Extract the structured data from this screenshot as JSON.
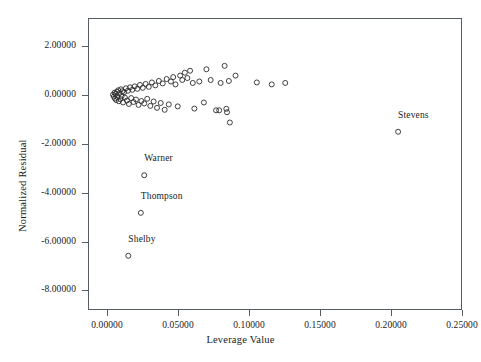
{
  "chart_data": {
    "type": "scatter",
    "title": "",
    "xlabel": "Leverage Value",
    "ylabel": "Normalized Residual",
    "xlim": [
      -0.0134,
      0.25
    ],
    "ylim": [
      -8.8,
      3.16
    ],
    "grid": false,
    "legend": null,
    "xticks": [
      0.0,
      0.05,
      0.1,
      0.15,
      0.2,
      0.25
    ],
    "xticklabels": [
      "0.00000",
      "0.05000",
      "0.10000",
      "0.15000",
      "0.20000",
      "0.25000"
    ],
    "yticks": [
      2.0,
      0.0,
      -2.0,
      -4.0,
      -6.0,
      -8.0
    ],
    "yticklabels": [
      "2.00000",
      "0.00000",
      "-2.00000",
      "-4.00000",
      "-6.00000",
      "-8.00000"
    ],
    "marker": "open-circle",
    "marker_color": "#2b2b2b",
    "points": [
      {
        "x": 0.0042,
        "y": 0.02
      },
      {
        "x": 0.0048,
        "y": -0.06
      },
      {
        "x": 0.0053,
        "y": 0.1
      },
      {
        "x": 0.0056,
        "y": -0.14
      },
      {
        "x": 0.0061,
        "y": 0.05
      },
      {
        "x": 0.0065,
        "y": -0.2
      },
      {
        "x": 0.007,
        "y": 0.14
      },
      {
        "x": 0.0074,
        "y": -0.08
      },
      {
        "x": 0.0079,
        "y": 0.2
      },
      {
        "x": 0.0083,
        "y": -0.25
      },
      {
        "x": 0.0088,
        "y": 0.08
      },
      {
        "x": 0.0093,
        "y": -0.16
      },
      {
        "x": 0.0098,
        "y": 0.24
      },
      {
        "x": 0.0103,
        "y": -0.04
      },
      {
        "x": 0.0108,
        "y": 0.16
      },
      {
        "x": 0.0113,
        "y": -0.3
      },
      {
        "x": 0.012,
        "y": 0.12
      },
      {
        "x": 0.0126,
        "y": -0.1
      },
      {
        "x": 0.0133,
        "y": 0.28
      },
      {
        "x": 0.014,
        "y": -0.22
      },
      {
        "x": 0.0147,
        "y": 0.18
      },
      {
        "x": 0.0154,
        "y": -0.36
      },
      {
        "x": 0.0162,
        "y": 0.32
      },
      {
        "x": 0.017,
        "y": -0.12
      },
      {
        "x": 0.0178,
        "y": 0.22
      },
      {
        "x": 0.0186,
        "y": -0.28
      },
      {
        "x": 0.0195,
        "y": 0.36
      },
      {
        "x": 0.0204,
        "y": -0.18
      },
      {
        "x": 0.0213,
        "y": 0.26
      },
      {
        "x": 0.0222,
        "y": -0.4
      },
      {
        "x": 0.0232,
        "y": 0.42
      },
      {
        "x": 0.0242,
        "y": -0.24
      },
      {
        "x": 0.0252,
        "y": 0.3
      },
      {
        "x": 0.0262,
        "y": -0.34
      },
      {
        "x": 0.0272,
        "y": 0.46
      },
      {
        "x": 0.0283,
        "y": -0.15
      },
      {
        "x": 0.0294,
        "y": 0.34
      },
      {
        "x": 0.0305,
        "y": -0.44
      },
      {
        "x": 0.0316,
        "y": 0.52
      },
      {
        "x": 0.0328,
        "y": -0.26
      },
      {
        "x": 0.034,
        "y": 0.4
      },
      {
        "x": 0.0352,
        "y": -0.52
      },
      {
        "x": 0.0365,
        "y": 0.58
      },
      {
        "x": 0.0378,
        "y": -0.32
      },
      {
        "x": 0.0392,
        "y": 0.48
      },
      {
        "x": 0.0406,
        "y": -0.6
      },
      {
        "x": 0.042,
        "y": 0.66
      },
      {
        "x": 0.0435,
        "y": -0.38
      },
      {
        "x": 0.045,
        "y": 0.56
      },
      {
        "x": 0.0466,
        "y": 0.74
      },
      {
        "x": 0.0482,
        "y": 0.44
      },
      {
        "x": 0.0498,
        "y": -0.46
      },
      {
        "x": 0.0515,
        "y": 0.8
      },
      {
        "x": 0.053,
        "y": 0.62
      },
      {
        "x": 0.0548,
        "y": 0.92
      },
      {
        "x": 0.0566,
        "y": 0.7
      },
      {
        "x": 0.0585,
        "y": 1.0
      },
      {
        "x": 0.0604,
        "y": 0.5
      },
      {
        "x": 0.0615,
        "y": -0.55
      },
      {
        "x": 0.065,
        "y": 0.56
      },
      {
        "x": 0.0682,
        "y": -0.3
      },
      {
        "x": 0.07,
        "y": 1.06
      },
      {
        "x": 0.073,
        "y": 0.62
      },
      {
        "x": 0.0768,
        "y": -0.62
      },
      {
        "x": 0.079,
        "y": -0.62
      },
      {
        "x": 0.08,
        "y": 0.5
      },
      {
        "x": 0.0828,
        "y": 1.2
      },
      {
        "x": 0.084,
        "y": -0.56
      },
      {
        "x": 0.0845,
        "y": -0.7
      },
      {
        "x": 0.0858,
        "y": 0.58
      },
      {
        "x": 0.0865,
        "y": -1.12
      },
      {
        "x": 0.0905,
        "y": 0.8
      },
      {
        "x": 0.1055,
        "y": 0.52
      },
      {
        "x": 0.116,
        "y": 0.44
      },
      {
        "x": 0.1255,
        "y": 0.5
      },
      {
        "x": 0.205,
        "y": -1.5
      },
      {
        "x": 0.0262,
        "y": -3.28
      },
      {
        "x": 0.0238,
        "y": -4.82
      },
      {
        "x": 0.015,
        "y": -6.58
      }
    ],
    "annotations": [
      {
        "label": "Stevens",
        "x": 0.205,
        "y": -1.5,
        "dx": 0,
        "dy": 0.62
      },
      {
        "label": "Warner",
        "x": 0.0262,
        "y": -3.28,
        "dx": 0,
        "dy": 0.62
      },
      {
        "label": "Thompson",
        "x": 0.0238,
        "y": -4.82,
        "dx": 0,
        "dy": 0.62
      },
      {
        "label": "Shelby",
        "x": 0.015,
        "y": -6.58,
        "dx": 0,
        "dy": 0.62
      }
    ]
  }
}
